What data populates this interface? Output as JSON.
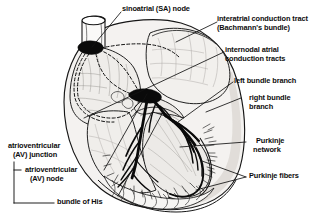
{
  "figure": {
    "type": "anatomical-diagram",
    "background_color": "#ffffff",
    "ink_color": "#0d0d0d",
    "tissue_fill": "#e8e6e3",
    "chamber_fill": "#f6f5f3"
  },
  "labels": {
    "sa_node": "sinoatrial (SA) node",
    "interatrial_l1": "interatrial conduction tract",
    "interatrial_l2": "(Bachmann's bundle)",
    "internodal_l1": "internodal atrial",
    "internodal_l2": "conduction tracts",
    "left_bundle_branch": "left bundle branch",
    "right_bundle_l1": "right bundle",
    "right_bundle_l2": "branch",
    "purkinje_network_l1": "Purkinje",
    "purkinje_network_l2": "network",
    "purkinje_fibers": "Purkinje fibers",
    "av_junction_l1": "atrioventricular",
    "av_junction_l2": "(AV) junction",
    "av_node_l1": "atrioventricular",
    "av_node_l2": "(AV) node",
    "bundle_of_his": "bundle of His"
  },
  "structures": {
    "sa_node_marker": "sa-node-blob",
    "av_node_marker": "av-node-blob",
    "conduction_pathway": "bundle-of-his-and-branches",
    "dashed_tracts": "internodal-and-interatrial-dashed-paths"
  }
}
